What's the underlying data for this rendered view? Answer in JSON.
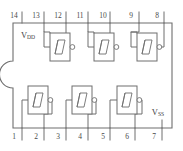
{
  "diagram": {
    "banner_text": "",
    "package": {
      "type": "DIP-14",
      "notch": "left-edge-semicircle",
      "pin_count": 14
    },
    "colors": {
      "line": "#6e6e6e",
      "background": "#ffffff",
      "text": "#4a4a4a",
      "banner": "#e2e2e2"
    },
    "rails": {
      "vdd": {
        "label": "V",
        "sub": "DD",
        "pin": "14"
      },
      "vss": {
        "label": "V",
        "sub": "SS",
        "pin": "7"
      }
    },
    "pins_top": [
      {
        "num": "14"
      },
      {
        "num": "13"
      },
      {
        "num": "12"
      },
      {
        "num": "11"
      },
      {
        "num": "10"
      },
      {
        "num": "9"
      },
      {
        "num": "8"
      }
    ],
    "pins_bottom": [
      {
        "num": "1"
      },
      {
        "num": "2"
      },
      {
        "num": "3"
      },
      {
        "num": "4"
      },
      {
        "num": "5"
      },
      {
        "num": "6"
      },
      {
        "num": "7"
      }
    ],
    "gates": [
      {
        "id": "gate-top-1",
        "symbol": "schmitt-inverter",
        "input_pin": "13",
        "output_pin": "12",
        "row": "top"
      },
      {
        "id": "gate-top-2",
        "symbol": "schmitt-inverter",
        "input_pin": "11",
        "output_pin": "10",
        "row": "top"
      },
      {
        "id": "gate-top-3",
        "symbol": "schmitt-inverter",
        "input_pin": "9",
        "output_pin": "8",
        "row": "top"
      },
      {
        "id": "gate-bottom-1",
        "symbol": "schmitt-inverter",
        "input_pin": "1",
        "output_pin": "2",
        "row": "bottom"
      },
      {
        "id": "gate-bottom-2",
        "symbol": "schmitt-inverter",
        "input_pin": "3",
        "output_pin": "4",
        "row": "bottom"
      },
      {
        "id": "gate-bottom-3",
        "symbol": "schmitt-inverter",
        "input_pin": "5",
        "output_pin": "6",
        "row": "bottom"
      }
    ]
  }
}
